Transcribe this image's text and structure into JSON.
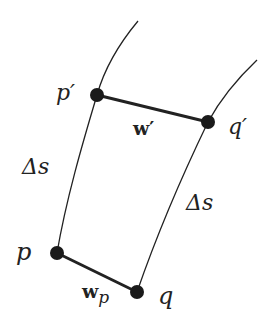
{
  "diagram": {
    "labels": {
      "p_prime": "p′",
      "q_prime": "q′",
      "w_prime": "w′",
      "delta_s_left": "Δs",
      "delta_s_right": "Δs",
      "p": "p",
      "q": "q",
      "w_p_main": "w",
      "w_p_sub": "p"
    },
    "colors": {
      "stroke": "#222222",
      "background": "#ffffff"
    }
  }
}
